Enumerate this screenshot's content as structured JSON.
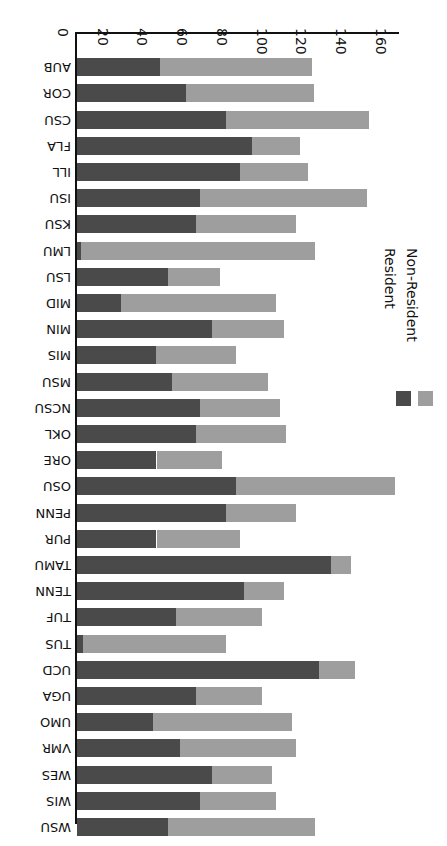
{
  "chart_data": {
    "type": "bar",
    "orientation": "horizontal",
    "stacked": true,
    "rotated_180": true,
    "title": "",
    "xlabel": "",
    "ylabel": "",
    "xlim": [
      0,
      160
    ],
    "grid": false,
    "legend_position": "middle-left",
    "colors": {
      "non_resident": "#9e9e9e",
      "resident": "#4a4a4a",
      "axis": "#111111",
      "background": "#ffffff"
    },
    "xticks": [
      "0",
      "20",
      "40",
      "60",
      "80",
      "100",
      "120",
      "140",
      "160"
    ],
    "categories": [
      "WSU",
      "WIS",
      "WES",
      "VMR",
      "UMO",
      "UGA",
      "UCD",
      "TUS",
      "TUF",
      "TENN",
      "TAMU",
      "PUR",
      "PENN",
      "OSU",
      "ORE",
      "OKL",
      "NCSU",
      "MSU",
      "MIS",
      "MIN",
      "MID",
      "LSU",
      "LMU",
      "KSU",
      "ISU",
      "ILL",
      "FLA",
      "CSU",
      "COR",
      "AUB"
    ],
    "series": [
      {
        "name": "Resident",
        "key": "resident",
        "color": "#4a4a4a",
        "values": [
          46,
          62,
          68,
          52,
          38,
          60,
          122,
          3,
          50,
          84,
          128,
          40,
          75,
          80,
          40,
          60,
          62,
          48,
          40,
          68,
          22,
          46,
          2,
          60,
          62,
          82,
          88,
          75,
          55,
          42
        ]
      },
      {
        "name": "Non-Resident",
        "key": "non_resident",
        "color": "#9e9e9e",
        "values": [
          74,
          38,
          30,
          58,
          70,
          33,
          18,
          72,
          43,
          20,
          10,
          42,
          35,
          80,
          33,
          45,
          40,
          48,
          40,
          36,
          78,
          26,
          118,
          50,
          84,
          34,
          24,
          72,
          64,
          76
        ]
      }
    ],
    "totals": [
      120,
      100,
      98,
      110,
      108,
      93,
      140,
      75,
      93,
      104,
      138,
      82,
      110,
      160,
      73,
      105,
      102,
      96,
      80,
      104,
      100,
      72,
      120,
      110,
      146,
      116,
      112,
      147,
      119,
      118
    ]
  },
  "legend": {
    "entries": [
      {
        "label": "Non-Resident",
        "color": "#9e9e9e"
      },
      {
        "label": "Resident",
        "color": "#4a4a4a"
      }
    ]
  }
}
